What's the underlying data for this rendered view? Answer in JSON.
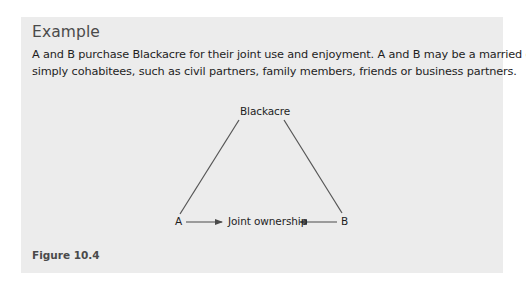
{
  "example": {
    "heading": "Example",
    "paragraph_lines": [
      "A and B purchase Blackacre for their joint use and enjoyment. A and B may be a married couple or",
      "simply cohabitees, such as civil partners, family members, friends or business partners."
    ]
  },
  "diagram": {
    "nodes": {
      "top": "Blackacre",
      "left": "A",
      "center": "Joint ownership",
      "right": "B"
    },
    "edges": [
      {
        "from": "Blackacre",
        "to": "A",
        "type": "line"
      },
      {
        "from": "Blackacre",
        "to": "B",
        "type": "line"
      },
      {
        "from": "A",
        "to": "Joint ownership",
        "type": "arrow"
      },
      {
        "from": "B",
        "to": "Joint ownership",
        "type": "arrow"
      }
    ],
    "colors": {
      "line": "#4a4a4a",
      "background": "#ececec"
    }
  },
  "figure": {
    "caption": "Figure 10.4"
  }
}
